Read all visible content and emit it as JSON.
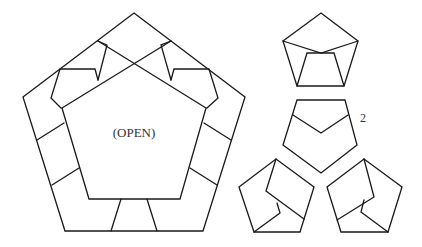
{
  "diagram": {
    "type": "folding-diagram",
    "stroke_color": "#1a1a1a",
    "main_figure": {
      "label": "(OPEN)",
      "outer_pentagon": [
        [
          134,
          13
        ],
        [
          245,
          97
        ],
        [
          203,
          231
        ],
        [
          65,
          231
        ],
        [
          23,
          97
        ]
      ],
      "inner_pentagon": [
        [
          134,
          54
        ],
        [
          206,
          108
        ],
        [
          180,
          199
        ],
        [
          89,
          199
        ],
        [
          62,
          108
        ]
      ]
    },
    "side_figures": [
      {
        "id": "top",
        "label": ""
      },
      {
        "id": "middle",
        "label": "2"
      },
      {
        "id": "bottom-left",
        "label": ""
      },
      {
        "id": "bottom-right",
        "label": ""
      }
    ]
  }
}
